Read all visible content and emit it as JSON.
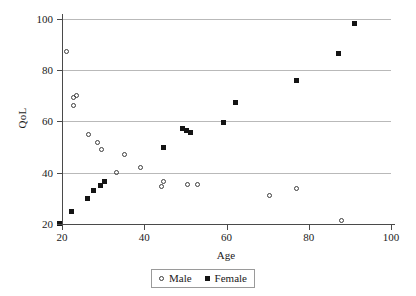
{
  "chart_data": {
    "type": "scatter",
    "title": "",
    "xlabel": "Age",
    "ylabel": "QoL",
    "xlim": [
      15,
      102
    ],
    "ylim": [
      17,
      103
    ],
    "xticks": [
      20,
      40,
      60,
      80,
      100
    ],
    "yticks": [
      20,
      40,
      60,
      80,
      100
    ],
    "grid": "horizontal",
    "legend_position": "bottom-center",
    "series": [
      {
        "name": "Male",
        "marker": "open-circle",
        "color": "#3d3d3d",
        "points": [
          [
            21.2,
            87.1
          ],
          [
            22.7,
            69.4
          ],
          [
            23.6,
            70.2
          ],
          [
            22.9,
            66.1
          ],
          [
            26.5,
            54.8
          ],
          [
            28.6,
            51.6
          ],
          [
            29.5,
            49.2
          ],
          [
            33.3,
            39.9
          ],
          [
            35.3,
            47.2
          ],
          [
            39.1,
            42.1
          ],
          [
            44.6,
            36.4
          ],
          [
            44.2,
            34.5
          ],
          [
            50.5,
            35.5
          ],
          [
            52.9,
            35.5
          ],
          [
            70.4,
            31.0
          ],
          [
            77.1,
            34.0
          ],
          [
            87.9,
            21.4
          ]
        ]
      },
      {
        "name": "Female",
        "marker": "filled-square",
        "color": "#141414",
        "points": [
          [
            19.3,
            20.1
          ],
          [
            22.4,
            24.9
          ],
          [
            26.3,
            30.0
          ],
          [
            27.7,
            33.2
          ],
          [
            29.4,
            34.9
          ],
          [
            30.4,
            36.7
          ],
          [
            44.6,
            49.7
          ],
          [
            49.3,
            57.3
          ],
          [
            50.3,
            56.3
          ],
          [
            51.3,
            55.5
          ],
          [
            59.2,
            59.6
          ],
          [
            62.3,
            67.2
          ],
          [
            77.0,
            76.1
          ],
          [
            87.2,
            86.5
          ],
          [
            91.2,
            98.0
          ]
        ]
      }
    ]
  },
  "legend": {
    "entries": [
      {
        "label": "Male",
        "marker": "open-circle"
      },
      {
        "label": "Female",
        "marker": "filled-square"
      }
    ]
  }
}
